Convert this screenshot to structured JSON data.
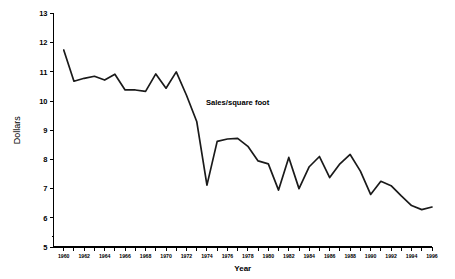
{
  "chart_data": {
    "type": "line",
    "title": "",
    "xlabel": "Year",
    "ylabel": "Dollars",
    "xlim": [
      1959,
      1996
    ],
    "ylim": [
      5,
      13
    ],
    "grid": false,
    "legend": "none",
    "annotations": [
      {
        "text": "Sales/square foot",
        "x": 1977,
        "y": 9.85
      }
    ],
    "ytick_labels": [
      "5",
      "6",
      "7",
      "8",
      "9",
      "10",
      "11",
      "12",
      "13"
    ],
    "ytick_values": [
      5,
      6,
      7,
      8,
      9,
      10,
      11,
      12,
      13
    ],
    "xtick_labels": [
      "1960",
      "1962",
      "1964",
      "1966",
      "1968",
      "1970",
      "1972",
      "1974",
      "1976",
      "1978",
      "1980",
      "1982",
      "1984",
      "1986",
      "1988",
      "1990",
      "1992",
      "1994",
      "1996"
    ],
    "xtick_values": [
      1960,
      1962,
      1964,
      1966,
      1968,
      1970,
      1972,
      1974,
      1976,
      1978,
      1980,
      1982,
      1984,
      1986,
      1988,
      1990,
      1992,
      1994,
      1996
    ],
    "series": [
      {
        "name": "Sales/square foot",
        "color": "#1a1a1a",
        "x": [
          1960,
          1961,
          1962,
          1963,
          1964,
          1965,
          1966,
          1967,
          1968,
          1969,
          1970,
          1971,
          1972,
          1973,
          1974,
          1975,
          1976,
          1977,
          1978,
          1979,
          1980,
          1981,
          1982,
          1983,
          1984,
          1985,
          1986,
          1987,
          1988,
          1989,
          1990,
          1991,
          1992,
          1993,
          1994,
          1995,
          1996
        ],
        "values": [
          11.75,
          10.68,
          10.78,
          10.85,
          10.72,
          10.92,
          10.38,
          10.38,
          10.33,
          10.93,
          10.44,
          11.0,
          10.2,
          9.3,
          7.12,
          8.62,
          8.7,
          8.72,
          8.45,
          7.95,
          7.85,
          6.95,
          8.07,
          7.0,
          7.75,
          8.1,
          7.38,
          7.85,
          8.17,
          7.6,
          6.8,
          7.25,
          7.1,
          6.75,
          6.42,
          6.28,
          6.37
        ]
      }
    ]
  },
  "axes": {
    "y_label": "Dollars",
    "x_label": "Year"
  }
}
